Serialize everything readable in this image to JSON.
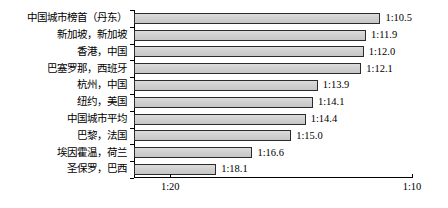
{
  "chart_data": {
    "type": "bar",
    "orientation": "horizontal",
    "title": "",
    "xlabel": "",
    "ylabel": "",
    "categories": [
      "中国城市榜首（丹东）",
      "新加坡，新加坡",
      "香港，中国",
      "巴塞罗那，西班牙",
      "杭州，中国",
      "纽约，美国",
      "中国城市平均",
      "巴黎，法国",
      "埃因霍温，荷兰",
      "圣保罗，巴西"
    ],
    "values": [
      10.5,
      11.9,
      12.0,
      12.1,
      13.9,
      14.1,
      14.4,
      15.0,
      16.6,
      18.1
    ],
    "value_labels": [
      "1:10.5",
      "1:11.9",
      "1:12.0",
      "1:12.1",
      "1:13.9",
      "1:14.1",
      "1:14.4",
      "1:15.0",
      "1:16.6",
      "1:18.1"
    ],
    "xticks": [
      20,
      10
    ],
    "xtick_labels": [
      "1:20",
      "1:10"
    ],
    "xlim": [
      21.5,
      10.0
    ],
    "axis_reversed": true,
    "grid": false,
    "legend": null,
    "bar_color": "#d2d2d2",
    "bar_edge_color": "#2b2b2b"
  }
}
